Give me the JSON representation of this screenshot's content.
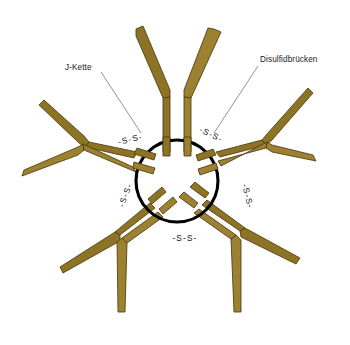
{
  "figure": {
    "background_color": "#ffffff",
    "width": 350,
    "height": 345
  },
  "labels": {
    "j_chain": "J-Kette",
    "disulfide_bridges": "Disulfidbrücken"
  },
  "bonds": {
    "label": "-S-S-",
    "items": [
      {
        "id": "bond-top-left",
        "text": "-S-S-",
        "x": 131,
        "y": 142,
        "rotation": -14
      },
      {
        "id": "bond-top-right",
        "text": "-S-S-",
        "x": 210,
        "y": 137,
        "rotation": 26
      },
      {
        "id": "bond-right",
        "text": "-S-S-",
        "x": 245,
        "y": 197,
        "rotation": 76
      },
      {
        "id": "bond-bottom",
        "text": "-S-S-",
        "x": 185,
        "y": 241,
        "rotation": 0
      },
      {
        "id": "bond-left",
        "text": "-S-S-",
        "x": 128,
        "y": 196,
        "rotation": -70
      }
    ]
  },
  "ring": {
    "name": "j-chain-ring",
    "center_x": 177,
    "center_y": 181,
    "radius_x": 41,
    "radius_y": 41,
    "stroke_color": "#000000"
  },
  "colors": {
    "arm_fill": "#8d7324",
    "arm_fill_light": "#9c8130",
    "arm_stroke": "#4c3c10",
    "ring_stroke": "#000000",
    "leader_line": "#6e6e76",
    "text": "#1a1a1a",
    "background": "#ffffff"
  },
  "monomers": {
    "count": 5,
    "description": "Fünf Y-förmige IgM-Monomere radial um den zentralen Ring angeordnet",
    "ids": [
      "monomer-top",
      "monomer-upper-right",
      "monomer-lower-right",
      "monomer-lower-left",
      "monomer-upper-left"
    ]
  },
  "leaders": {
    "j_chain_line": {
      "x1": 101,
      "y1": 72,
      "x2": 141,
      "y2": 133
    },
    "disulfide_line": {
      "x1": 258,
      "y1": 66,
      "x2": 214,
      "y2": 133
    }
  }
}
